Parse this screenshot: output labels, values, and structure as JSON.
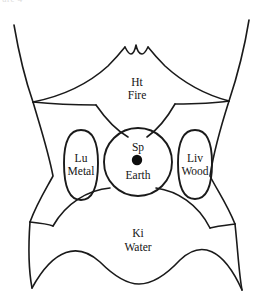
{
  "figure": {
    "background_color": "#ffffff",
    "line_color": "#1a1a1a",
    "text_color": "#141414",
    "width": 271,
    "height": 303,
    "top_crop_fragment": "ure 4"
  },
  "zones": [
    {
      "id": "heart-fire",
      "organ_abbr": "Ht",
      "element": "Fire",
      "shape": "upper-epigastric-diamond",
      "label_x": 137,
      "label_y": 88
    },
    {
      "id": "lung-metal",
      "organ_abbr": "Lu",
      "element": "Metal",
      "shape": "left-vertical-oval",
      "label_x": 81,
      "label_y": 165
    },
    {
      "id": "spleen-earth",
      "organ_abbr": "Sp",
      "element": "Earth",
      "shape": "center-circle",
      "label_x": 138,
      "label_y": 152,
      "has_center_dot": true,
      "dot_x": 137,
      "dot_y": 160,
      "dot_radius": 5.2
    },
    {
      "id": "liver-wood",
      "organ_abbr": "Liv",
      "element": "Wood",
      "shape": "right-vertical-oval",
      "label_x": 195,
      "label_y": 165
    },
    {
      "id": "kidney-water",
      "organ_abbr": "Ki",
      "element": "Water",
      "shape": "lower-abdomen-dome",
      "label_x": 138,
      "label_y": 240
    }
  ]
}
